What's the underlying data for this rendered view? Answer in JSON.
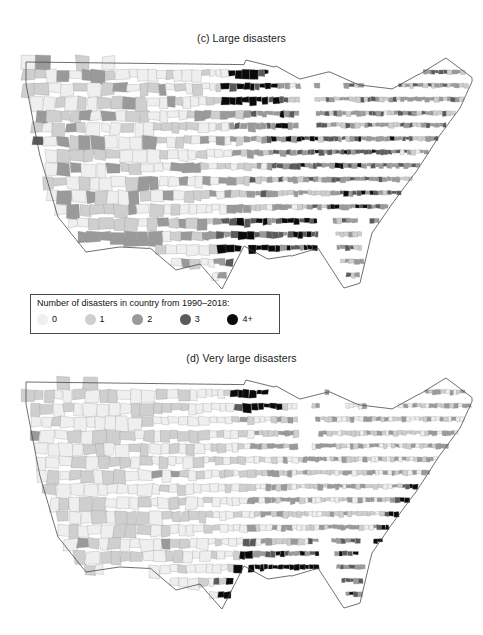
{
  "figure": {
    "panels": [
      {
        "id": "c",
        "title": "(c) Large disasters",
        "legend": {
          "title": "Number of disasters in country from 1990–2018:",
          "items": [
            {
              "label": "0",
              "color": "#efefef"
            },
            {
              "label": "1",
              "color": "#cfcfcf"
            },
            {
              "label": "2",
              "color": "#9a9a9a"
            },
            {
              "label": "3",
              "color": "#5a5a5a"
            },
            {
              "label": "4+",
              "color": "#0a0a0a"
            }
          ]
        }
      },
      {
        "id": "d",
        "title": "(d) Very large disasters",
        "legend": {
          "title": "Number of disasters in country from 1990–2018:",
          "items": [
            {
              "label": "0",
              "color": "#efefef"
            },
            {
              "label": "1",
              "color": "#cfcfcf"
            },
            {
              "label": "2",
              "color": "#9a9a9a"
            },
            {
              "label": "3",
              "color": "#5a5a5a"
            },
            {
              "label": "4+",
              "color": "#0a0a0a"
            }
          ]
        }
      }
    ]
  },
  "chart_data": {
    "type": "heatmap",
    "subtitle": "Two choropleth maps of US counties",
    "xlabel": "",
    "ylabel": "",
    "legend_position": "below-map-left",
    "grid": false,
    "categories": [
      "0",
      "1",
      "2",
      "3",
      "4+"
    ],
    "color_scale": [
      "#efefef",
      "#cfcfcf",
      "#9a9a9a",
      "#5a5a5a",
      "#0a0a0a"
    ],
    "panels": [
      {
        "panel": "(c) Large disasters",
        "unit": "US county",
        "value_range": [
          0,
          4
        ],
        "legend_title": "Number of disasters in country from 1990–2018:",
        "regional_summary": [
          {
            "region": "Pacific Northwest (WA/OR)",
            "typical_value": 1,
            "notes": "mostly 0–1, a few level-3 counties on the Oregon coast"
          },
          {
            "region": "California",
            "typical_value": 1,
            "notes": "coastal counties 1–2, southern desert counties 2"
          },
          {
            "region": "Mountain West (NV/UT/ID/MT/WY)",
            "typical_value": 0,
            "notes": "large sparse counties, predominantly 0"
          },
          {
            "region": "North Dakota / northern Minnesota",
            "typical_value": 4,
            "notes": "dense cluster of 4+ black counties"
          },
          {
            "region": "South Dakota / Nebraska",
            "typical_value": 2,
            "notes": "scattered 2–3"
          },
          {
            "region": "Iowa / Missouri / Illinois",
            "typical_value": 2,
            "notes": "frequent 3 and 4+ counties along river valleys"
          },
          {
            "region": "Gulf Coast (TX/LA/MS/AL)",
            "typical_value": 3,
            "notes": "many 4+ counties, heaviest near Louisiana"
          },
          {
            "region": "Florida",
            "typical_value": 2,
            "notes": "peninsular counties 2–3, a few 4+"
          },
          {
            "region": "Appalachia / Mid-Atlantic",
            "typical_value": 2,
            "notes": "moderate 1–3 with isolated 4+"
          },
          {
            "region": "Northeast / New England",
            "typical_value": 1,
            "notes": "mostly 1–2; Maine largely 1"
          }
        ]
      },
      {
        "panel": "(d) Very large disasters",
        "unit": "US county",
        "value_range": [
          0,
          4
        ],
        "legend_title": "Number of disasters in country from 1990–2018:",
        "regional_summary": [
          {
            "region": "Pacific Northwest (WA/OR)",
            "typical_value": 0,
            "notes": "nearly all 0, a couple of level-2 counties"
          },
          {
            "region": "California",
            "typical_value": 0,
            "notes": "one black 4+ county near the Bay Area"
          },
          {
            "region": "Mountain West",
            "typical_value": 0,
            "notes": "overwhelmingly 0"
          },
          {
            "region": "North Dakota / northwest Minnesota",
            "typical_value": 4,
            "notes": "strong black 4+ cluster, largest inland concentration"
          },
          {
            "region": "Great Plains (KS/NE/OK)",
            "typical_value": 1,
            "notes": "light 0–2 with scattered darker counties"
          },
          {
            "region": "Midwest (IA/IL/IN/OH)",
            "typical_value": 1,
            "notes": "mostly 1, isolated dark counties"
          },
          {
            "region": "Gulf Coast (TX/LA/MS/AL/FL panhandle)",
            "typical_value": 4,
            "notes": "continuous band of 4+ black coastal counties"
          },
          {
            "region": "Florida",
            "typical_value": 2,
            "notes": "southern tip and coasts 2–4"
          },
          {
            "region": "Carolina coast (NC/SC)",
            "typical_value": 4,
            "notes": "dense black 4+ coastal band"
          },
          {
            "region": "Northeast / New England",
            "typical_value": 1,
            "notes": "mostly 0–1; one 4+ county near New Jersey"
          }
        ]
      }
    ]
  }
}
